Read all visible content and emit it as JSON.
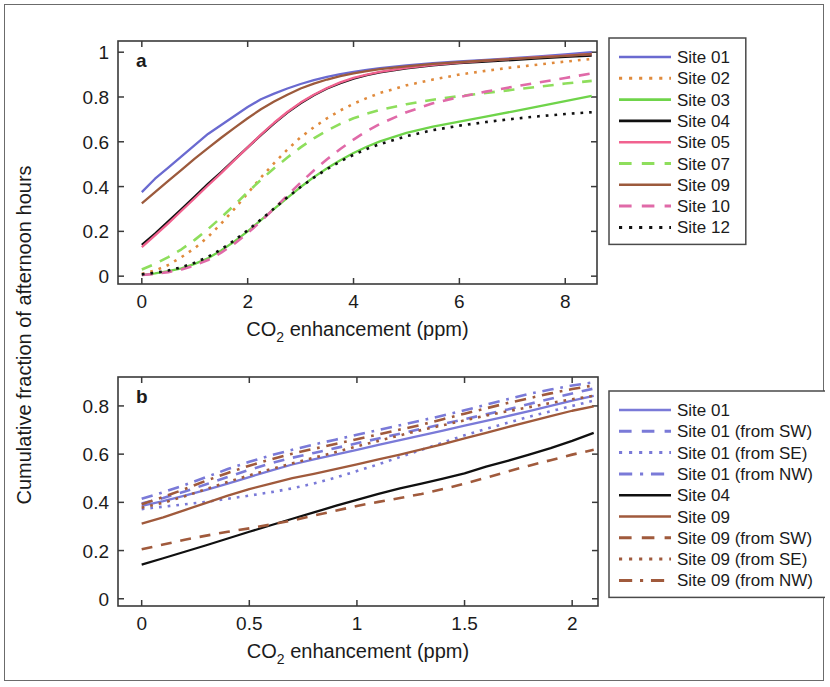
{
  "figure": {
    "ylabel": "Cumulative fraction of afternoon hours",
    "panel_a_letter": "a",
    "panel_b_letter": "b"
  },
  "colors": {
    "blue": "#6a6ad0",
    "orange_dot": "#e08a3c",
    "green_bright": "#6fd44a",
    "black": "#101010",
    "pink": "#f1628f",
    "green_light": "#8ede5c",
    "brown": "#9c5a3c",
    "pink_dash": "#e06aa8",
    "black_dot": "#101010",
    "blue_b": "#7a7ad8",
    "brown_b": "#a05a3c",
    "axis": "#3a3a3a",
    "frame": "#6b6b6b"
  },
  "chart_data": [
    {
      "type": "line",
      "panel": "a",
      "title": "",
      "xlabel": "CO2 enhancement (ppm)",
      "ylabel": "Cumulative fraction of afternoon hours",
      "xlabel_parts": {
        "pre": "CO",
        "sub": "2",
        "post": " enhancement (ppm)"
      },
      "xlim": [
        -0.45,
        8.6
      ],
      "ylim": [
        -0.035,
        1.05
      ],
      "xticks": [
        0,
        2,
        4,
        6,
        8
      ],
      "xticklabels": [
        "0",
        "2",
        "4",
        "6",
        "8"
      ],
      "yticks": [
        0,
        0.2,
        0.4,
        0.6,
        0.8,
        1
      ],
      "yticklabels": [
        "0",
        "0.2",
        "0.4",
        "0.6",
        "0.8",
        "1"
      ],
      "grid": false,
      "legend_position": "right-outside",
      "x": [
        0,
        0.25,
        0.5,
        0.75,
        1,
        1.25,
        1.5,
        1.75,
        2,
        2.25,
        2.5,
        2.75,
        3,
        3.25,
        3.5,
        3.75,
        4,
        4.25,
        4.5,
        5,
        5.5,
        6,
        6.5,
        7,
        7.5,
        8,
        8.5
      ],
      "series": [
        {
          "name": "Site 01",
          "color": "#6a6ad0",
          "style": "solid",
          "values": [
            0.375,
            0.435,
            0.485,
            0.535,
            0.585,
            0.635,
            0.675,
            0.715,
            0.755,
            0.79,
            0.815,
            0.838,
            0.858,
            0.875,
            0.89,
            0.902,
            0.912,
            0.921,
            0.929,
            0.941,
            0.951,
            0.959,
            0.966,
            0.973,
            0.981,
            0.99,
            1.0
          ]
        },
        {
          "name": "Site 02",
          "color": "#e08a3c",
          "style": "dotted",
          "values": [
            0.01,
            0.025,
            0.05,
            0.085,
            0.125,
            0.175,
            0.235,
            0.3,
            0.37,
            0.44,
            0.505,
            0.565,
            0.62,
            0.665,
            0.705,
            0.74,
            0.77,
            0.795,
            0.818,
            0.852,
            0.878,
            0.9,
            0.917,
            0.932,
            0.945,
            0.958,
            0.97
          ]
        },
        {
          "name": "Site 03",
          "color": "#6fd44a",
          "style": "solid",
          "values": [
            0.005,
            0.012,
            0.022,
            0.035,
            0.055,
            0.08,
            0.115,
            0.155,
            0.2,
            0.25,
            0.3,
            0.35,
            0.398,
            0.442,
            0.482,
            0.518,
            0.55,
            0.578,
            0.602,
            0.64,
            0.668,
            0.69,
            0.712,
            0.735,
            0.758,
            0.782,
            0.805
          ]
        },
        {
          "name": "Site 04",
          "color": "#101010",
          "style": "solid",
          "values": [
            0.14,
            0.19,
            0.245,
            0.3,
            0.355,
            0.412,
            0.465,
            0.52,
            0.575,
            0.63,
            0.682,
            0.73,
            0.772,
            0.808,
            0.838,
            0.862,
            0.882,
            0.898,
            0.91,
            0.928,
            0.941,
            0.951,
            0.958,
            0.965,
            0.972,
            0.979,
            0.985
          ]
        },
        {
          "name": "Site 05",
          "color": "#f1628f",
          "style": "solid",
          "values": [
            0.13,
            0.182,
            0.236,
            0.292,
            0.348,
            0.405,
            0.46,
            0.518,
            0.575,
            0.632,
            0.685,
            0.733,
            0.775,
            0.81,
            0.84,
            0.865,
            0.885,
            0.9,
            0.912,
            0.93,
            0.943,
            0.953,
            0.962,
            0.97,
            0.978,
            0.985,
            0.992
          ]
        },
        {
          "name": "Site 07",
          "color": "#8ede5c",
          "style": "dashed",
          "values": [
            0.03,
            0.055,
            0.085,
            0.12,
            0.162,
            0.21,
            0.262,
            0.318,
            0.375,
            0.43,
            0.482,
            0.53,
            0.575,
            0.615,
            0.65,
            0.68,
            0.705,
            0.725,
            0.742,
            0.768,
            0.788,
            0.804,
            0.818,
            0.832,
            0.846,
            0.86,
            0.872
          ]
        },
        {
          "name": "Site 09",
          "color": "#9c5a3c",
          "style": "solid",
          "values": [
            0.325,
            0.375,
            0.425,
            0.475,
            0.525,
            0.572,
            0.618,
            0.662,
            0.705,
            0.745,
            0.78,
            0.81,
            0.838,
            0.86,
            0.878,
            0.893,
            0.905,
            0.915,
            0.924,
            0.937,
            0.948,
            0.956,
            0.963,
            0.97,
            0.977,
            0.984,
            0.992
          ]
        },
        {
          "name": "Site 10",
          "color": "#e06aa8",
          "style": "dashed",
          "values": [
            0.005,
            0.01,
            0.018,
            0.03,
            0.048,
            0.072,
            0.105,
            0.145,
            0.192,
            0.245,
            0.302,
            0.36,
            0.418,
            0.472,
            0.522,
            0.568,
            0.61,
            0.648,
            0.68,
            0.732,
            0.772,
            0.8,
            0.824,
            0.845,
            0.865,
            0.885,
            0.905
          ]
        },
        {
          "name": "Site 12",
          "color": "#101010",
          "style": "dotted",
          "values": [
            0.008,
            0.015,
            0.025,
            0.04,
            0.06,
            0.086,
            0.12,
            0.16,
            0.205,
            0.253,
            0.302,
            0.352,
            0.398,
            0.44,
            0.478,
            0.512,
            0.542,
            0.568,
            0.59,
            0.625,
            0.652,
            0.672,
            0.688,
            0.702,
            0.714,
            0.724,
            0.732
          ]
        }
      ]
    },
    {
      "type": "line",
      "panel": "b",
      "title": "",
      "xlabel": "CO2 enhancement (ppm)",
      "ylabel": "Cumulative fraction of afternoon hours",
      "xlabel_parts": {
        "pre": "CO",
        "sub": "2",
        "post": " enhancement (ppm)"
      },
      "xlim": [
        -0.11,
        2.12
      ],
      "ylim": [
        -0.03,
        0.92
      ],
      "xticks": [
        0,
        0.5,
        1,
        1.5,
        2
      ],
      "xticklabels": [
        "0",
        "0.5",
        "1",
        "1.5",
        "2"
      ],
      "yticks": [
        0,
        0.2,
        0.4,
        0.6,
        0.8
      ],
      "yticklabels": [
        "0",
        "0.2",
        "0.4",
        "0.6",
        "0.8"
      ],
      "grid": false,
      "legend_position": "right-outside",
      "x": [
        0,
        0.1,
        0.2,
        0.3,
        0.4,
        0.5,
        0.6,
        0.7,
        0.8,
        0.9,
        1.0,
        1.1,
        1.2,
        1.3,
        1.4,
        1.5,
        1.6,
        1.7,
        1.8,
        1.9,
        2.0,
        2.1
      ],
      "series": [
        {
          "name": "Site 01",
          "color": "#7a7ad8",
          "style": "solid",
          "values": [
            0.385,
            0.405,
            0.428,
            0.452,
            0.478,
            0.505,
            0.532,
            0.557,
            0.578,
            0.598,
            0.618,
            0.638,
            0.658,
            0.678,
            0.698,
            0.718,
            0.738,
            0.758,
            0.778,
            0.8,
            0.822,
            0.842
          ]
        },
        {
          "name": "Site 01 (from SW)",
          "color": "#7a7ad8",
          "style": "dashed",
          "values": [
            0.395,
            0.418,
            0.445,
            0.475,
            0.505,
            0.535,
            0.562,
            0.585,
            0.605,
            0.625,
            0.645,
            0.665,
            0.685,
            0.705,
            0.725,
            0.745,
            0.765,
            0.785,
            0.808,
            0.83,
            0.852,
            0.872
          ]
        },
        {
          "name": "Site 01 (from SE)",
          "color": "#7a7ad8",
          "style": "dotted",
          "values": [
            0.372,
            0.382,
            0.392,
            0.402,
            0.415,
            0.428,
            0.442,
            0.458,
            0.478,
            0.502,
            0.53,
            0.558,
            0.588,
            0.618,
            0.648,
            0.678,
            0.705,
            0.73,
            0.755,
            0.778,
            0.8,
            0.822
          ]
        },
        {
          "name": "Site 01 (from NW)",
          "color": "#7a7ad8",
          "style": "dashdot",
          "values": [
            0.415,
            0.442,
            0.472,
            0.505,
            0.538,
            0.568,
            0.595,
            0.618,
            0.64,
            0.66,
            0.68,
            0.7,
            0.72,
            0.74,
            0.76,
            0.782,
            0.805,
            0.828,
            0.85,
            0.868,
            0.885,
            0.898
          ]
        },
        {
          "name": "Site 04",
          "color": "#101010",
          "style": "solid",
          "values": [
            0.142,
            0.168,
            0.195,
            0.222,
            0.25,
            0.278,
            0.305,
            0.332,
            0.358,
            0.385,
            0.41,
            0.435,
            0.458,
            0.478,
            0.498,
            0.52,
            0.548,
            0.572,
            0.598,
            0.625,
            0.655,
            0.688
          ]
        },
        {
          "name": "Site 09",
          "color": "#a05a3c",
          "style": "solid",
          "values": [
            0.312,
            0.338,
            0.368,
            0.398,
            0.428,
            0.455,
            0.478,
            0.5,
            0.518,
            0.538,
            0.558,
            0.578,
            0.598,
            0.62,
            0.642,
            0.665,
            0.688,
            0.712,
            0.735,
            0.758,
            0.78,
            0.798
          ]
        },
        {
          "name": "Site 09 (from SW)",
          "color": "#a05a3c",
          "style": "dashed",
          "values": [
            0.205,
            0.225,
            0.245,
            0.262,
            0.278,
            0.292,
            0.308,
            0.325,
            0.345,
            0.365,
            0.385,
            0.402,
            0.418,
            0.435,
            0.455,
            0.478,
            0.502,
            0.528,
            0.552,
            0.575,
            0.598,
            0.618
          ]
        },
        {
          "name": "Site 09 (from SE)",
          "color": "#a05a3c",
          "style": "dotted",
          "values": [
            0.378,
            0.398,
            0.425,
            0.455,
            0.485,
            0.512,
            0.538,
            0.562,
            0.585,
            0.608,
            0.632,
            0.655,
            0.678,
            0.7,
            0.72,
            0.74,
            0.76,
            0.778,
            0.795,
            0.812,
            0.828,
            0.842
          ]
        },
        {
          "name": "Site 09 (from NW)",
          "color": "#a05a3c",
          "style": "dashdot",
          "values": [
            0.392,
            0.422,
            0.455,
            0.49,
            0.522,
            0.552,
            0.578,
            0.602,
            0.622,
            0.642,
            0.662,
            0.682,
            0.702,
            0.722,
            0.745,
            0.768,
            0.79,
            0.812,
            0.832,
            0.852,
            0.87,
            0.885
          ]
        }
      ]
    }
  ],
  "legend_a": {
    "items": [
      {
        "label": "Site 01",
        "color": "#6a6ad0",
        "style": "solid"
      },
      {
        "label": "Site 02",
        "color": "#e08a3c",
        "style": "dotted"
      },
      {
        "label": "Site 03",
        "color": "#6fd44a",
        "style": "solid"
      },
      {
        "label": "Site 04",
        "color": "#101010",
        "style": "solid"
      },
      {
        "label": "Site 05",
        "color": "#f1628f",
        "style": "solid"
      },
      {
        "label": "Site 07",
        "color": "#8ede5c",
        "style": "dashed"
      },
      {
        "label": "Site 09",
        "color": "#9c5a3c",
        "style": "solid"
      },
      {
        "label": "Site 10",
        "color": "#e06aa8",
        "style": "dashed"
      },
      {
        "label": "Site 12",
        "color": "#101010",
        "style": "dotted"
      }
    ]
  },
  "legend_b": {
    "items": [
      {
        "label": "Site 01",
        "color": "#7a7ad8",
        "style": "solid"
      },
      {
        "label": "Site 01 (from SW)",
        "color": "#7a7ad8",
        "style": "dashed"
      },
      {
        "label": "Site 01 (from SE)",
        "color": "#7a7ad8",
        "style": "dotted"
      },
      {
        "label": "Site 01 (from NW)",
        "color": "#7a7ad8",
        "style": "dashdot"
      },
      {
        "label": "Site 04",
        "color": "#101010",
        "style": "solid"
      },
      {
        "label": "Site 09",
        "color": "#a05a3c",
        "style": "solid"
      },
      {
        "label": "Site 09 (from SW)",
        "color": "#a05a3c",
        "style": "dashed"
      },
      {
        "label": "Site 09 (from SE)",
        "color": "#a05a3c",
        "style": "dotted"
      },
      {
        "label": "Site 09 (from NW)",
        "color": "#a05a3c",
        "style": "dashdot"
      }
    ]
  }
}
